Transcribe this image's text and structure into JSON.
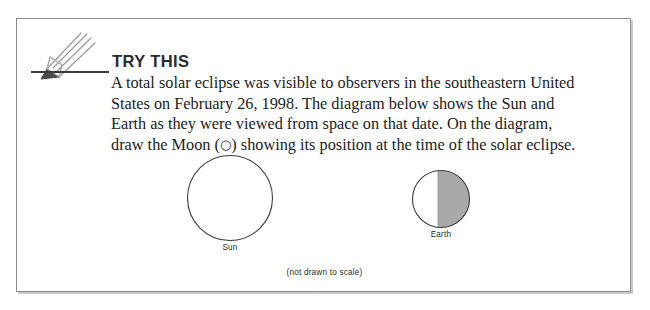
{
  "callout": {
    "heading": "TRY THIS",
    "icon": "pencil-icon",
    "body_lines": [
      "A total solar eclipse was visible to observers in the southeastern United",
      "States on February 26, 1998. The diagram below shows the Sun and",
      "Earth as they were viewed from space on that date. On the diagram,",
      "draw the Moon (○) showing its position at the time of the solar eclipse."
    ],
    "body_text": "A total solar eclipse was visible to observers in the southeastern United States on February 26, 1998. The diagram below shows the Sun and Earth as they were viewed from space on that date. On the diagram, draw the Moon (○) showing its position at the time of the solar eclipse.",
    "moon_symbol": "○"
  },
  "diagram": {
    "caption": "(not drawn to scale)",
    "bodies": [
      {
        "name": "Sun",
        "label": "Sun",
        "shape": "circle",
        "fill": "#ffffff",
        "stroke": "#3a3a3a",
        "diameter_px": 85,
        "shaded": false
      },
      {
        "name": "Earth",
        "label": "Earth",
        "shape": "circle",
        "fill": "#ffffff",
        "shade_fill": "#a9a9a9",
        "stroke": "#3a3a3a",
        "diameter_px": 57,
        "shaded": true,
        "shaded_side": "right"
      }
    ]
  },
  "colors": {
    "border": "#8d8d8d",
    "shadow": "#c9c9c9",
    "ink": "#1c1c1c",
    "heading": "#2b2b2b",
    "night_shade": "#a9a9a9",
    "background": "#ffffff"
  }
}
